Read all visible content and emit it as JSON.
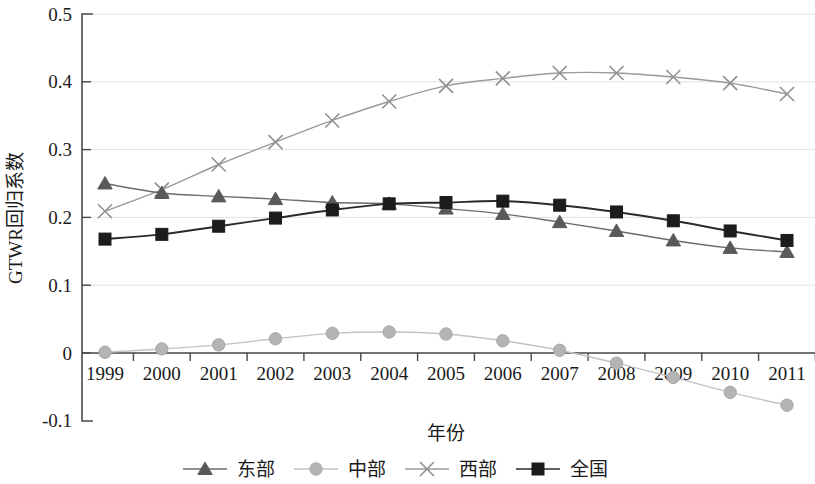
{
  "chart_data": {
    "type": "line",
    "title": "",
    "xlabel": "年份",
    "ylabel": "GTWR回归系数",
    "categories": [
      "1999",
      "2000",
      "2001",
      "2002",
      "2003",
      "2004",
      "2005",
      "2006",
      "2007",
      "2008",
      "2009",
      "2010",
      "2011"
    ],
    "x": [
      1999,
      2000,
      2001,
      2002,
      2003,
      2004,
      2005,
      2006,
      2007,
      2008,
      2009,
      2010,
      2011
    ],
    "xlim": [
      1999,
      2011
    ],
    "ylim": [
      -0.1,
      0.5
    ],
    "yticks": [
      -0.1,
      0,
      0.1,
      0.2,
      0.3,
      0.4,
      0.5
    ],
    "ytick_labels": [
      "-0.1",
      "0",
      "0.1",
      "0.2",
      "0.3",
      "0.4",
      "0.5"
    ],
    "grid": "horizontal",
    "legend_position": "bottom",
    "series": [
      {
        "name": "东部",
        "marker": "triangle",
        "color": "#5a5a5a",
        "line_color": "#6b6b6b",
        "values": [
          0.25,
          0.236,
          0.231,
          0.227,
          0.222,
          0.22,
          0.213,
          0.205,
          0.193,
          0.18,
          0.166,
          0.155,
          0.149
        ]
      },
      {
        "name": "中部",
        "marker": "circle",
        "color": "#b4b4b4",
        "line_color": "#c2c2c2",
        "values": [
          0.001,
          0.006,
          0.012,
          0.021,
          0.029,
          0.031,
          0.028,
          0.018,
          0.004,
          -0.015,
          -0.036,
          -0.058,
          -0.077
        ]
      },
      {
        "name": "西部",
        "marker": "x",
        "color": "#909090",
        "line_color": "#9a9a9a",
        "values": [
          0.209,
          0.241,
          0.278,
          0.311,
          0.343,
          0.371,
          0.394,
          0.405,
          0.413,
          0.413,
          0.407,
          0.398,
          0.382
        ]
      },
      {
        "name": "全国",
        "marker": "square",
        "color": "#1c1c1c",
        "line_color": "#2a2a2a",
        "values": [
          0.168,
          0.175,
          0.187,
          0.199,
          0.211,
          0.22,
          0.222,
          0.224,
          0.218,
          0.208,
          0.195,
          0.18,
          0.166
        ]
      }
    ]
  },
  "axes": {
    "y_title": "GTWR回归系数",
    "x_title": "年份"
  },
  "legend": {
    "items": [
      {
        "label": "东部",
        "marker": "triangle-marker"
      },
      {
        "label": "中部",
        "marker": "circle-marker"
      },
      {
        "label": "西部",
        "marker": "x-marker"
      },
      {
        "label": "全国",
        "marker": "square-marker"
      }
    ]
  },
  "colors": {
    "grid": "#e2e2e2",
    "axis": "#4a4a4a",
    "background": "#ffffff",
    "east": "#5a5a5a",
    "central": "#b4b4b4",
    "west": "#909090",
    "national": "#1c1c1c"
  }
}
